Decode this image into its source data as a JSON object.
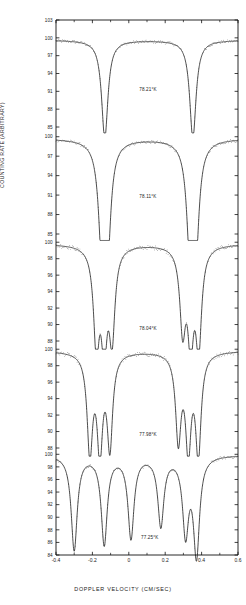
{
  "chart_data": {
    "type": "line",
    "title": "",
    "xlabel": "DOPPLER VELOCITY (CM/SEC)",
    "ylabel": "COUNTING RATE (ARBITRARY)",
    "xlim": [
      -0.4,
      0.6
    ],
    "xticks": [
      "-0.4",
      "-0.2",
      "0",
      "0.2",
      "0.4",
      "0.6"
    ],
    "xtick_values": [
      -0.4,
      -0.2,
      0,
      0.2,
      0.4,
      0.6
    ],
    "grid": false,
    "legend": "none",
    "panel_count": 5,
    "panels": [
      {
        "id": "panel-1",
        "annotation": "78.21°K",
        "annotation_x": 0.105,
        "annotation_y": 91.0,
        "ylim": [
          85,
          103
        ],
        "yticks": [
          "103",
          "100",
          "97",
          "94",
          "91",
          "88",
          "85"
        ],
        "ytick_values": [
          103,
          100,
          97,
          94,
          91,
          88,
          85
        ],
        "baseline": 99.6,
        "lines": [
          {
            "center": -0.132,
            "depth": 16.5,
            "width": 0.021
          },
          {
            "center": 0.352,
            "depth": 16.5,
            "width": 0.021
          }
        ]
      },
      {
        "id": "panel-2",
        "annotation": "78.11°K",
        "annotation_x": 0.105,
        "annotation_y": 90.5,
        "ylim": [
          85,
          101.5
        ],
        "yticks": [
          "100",
          "97",
          "94",
          "91",
          "88",
          "85"
        ],
        "ytick_values": [
          100,
          97,
          94,
          91,
          88,
          85
        ],
        "baseline": 99.7,
        "lines": [
          {
            "center": -0.147,
            "depth": 15.5,
            "width": 0.022
          },
          {
            "center": -0.118,
            "depth": 15.5,
            "width": 0.022
          },
          {
            "center": 0.337,
            "depth": 15.5,
            "width": 0.022
          },
          {
            "center": 0.367,
            "depth": 15.5,
            "width": 0.022
          }
        ]
      },
      {
        "id": "panel-3",
        "annotation": "78.04°K",
        "annotation_x": 0.105,
        "annotation_y": 89.3,
        "ylim": [
          88,
          101
        ],
        "yticks": [
          "100",
          "98",
          "96",
          "94",
          "92",
          "90",
          "88"
        ],
        "ytick_values": [
          100,
          98,
          96,
          94,
          92,
          90,
          88
        ],
        "baseline": 99.8,
        "lines": [
          {
            "center": -0.178,
            "depth": 11.8,
            "width": 0.019
          },
          {
            "center": -0.135,
            "depth": 11.3,
            "width": 0.019
          },
          {
            "center": -0.092,
            "depth": 10.6,
            "width": 0.019
          },
          {
            "center": 0.296,
            "depth": 9.6,
            "width": 0.019
          },
          {
            "center": 0.34,
            "depth": 11.0,
            "width": 0.019
          },
          {
            "center": 0.384,
            "depth": 11.8,
            "width": 0.019
          }
        ]
      },
      {
        "id": "panel-4",
        "annotation": "77.98°K",
        "annotation_x": 0.105,
        "annotation_y": 89.4,
        "ylim": [
          88,
          101
        ],
        "yticks": [
          "100",
          "98",
          "96",
          "94",
          "92",
          "90",
          "88"
        ],
        "ytick_values": [
          100,
          98,
          96,
          94,
          92,
          90,
          88
        ],
        "baseline": 99.8,
        "lines": [
          {
            "center": -0.214,
            "depth": 12.0,
            "width": 0.018
          },
          {
            "center": -0.159,
            "depth": 11.6,
            "width": 0.018
          },
          {
            "center": -0.104,
            "depth": 11.2,
            "width": 0.018
          },
          {
            "center": 0.272,
            "depth": 10.4,
            "width": 0.018
          },
          {
            "center": 0.327,
            "depth": 11.4,
            "width": 0.018
          },
          {
            "center": 0.382,
            "depth": 12.2,
            "width": 0.018
          }
        ]
      },
      {
        "id": "panel-5",
        "annotation": "77.25°K",
        "annotation_x": 0.115,
        "annotation_y": 86.6,
        "ylim": [
          84,
          101
        ],
        "yticks": [
          "100",
          "98",
          "96",
          "94",
          "92",
          "90",
          "88",
          "86",
          "84"
        ],
        "ytick_values": [
          100,
          98,
          96,
          94,
          92,
          90,
          88,
          86,
          84
        ],
        "baseline": 99.9,
        "lines": [
          {
            "center": -0.3,
            "depth": 15.0,
            "width": 0.02
          },
          {
            "center": -0.135,
            "depth": 14.0,
            "width": 0.02
          },
          {
            "center": 0.012,
            "depth": 13.0,
            "width": 0.02
          },
          {
            "center": 0.176,
            "depth": 11.0,
            "width": 0.02
          },
          {
            "center": 0.312,
            "depth": 12.0,
            "width": 0.02
          },
          {
            "center": 0.372,
            "depth": 15.5,
            "width": 0.02
          }
        ]
      }
    ]
  }
}
